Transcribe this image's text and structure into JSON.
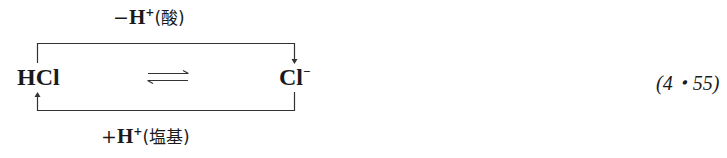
{
  "equation": {
    "top_label": {
      "sign": "−",
      "species": "H",
      "charge": "+",
      "annotation": "(酸)"
    },
    "bottom_label": {
      "sign": "+",
      "species": "H",
      "charge": "+",
      "annotation": "(塩基)"
    },
    "left_species": "HCl",
    "right_species": {
      "base": "Cl",
      "charge": "−"
    },
    "equilibrium_symbol": "⇌",
    "number": "(4・55)"
  }
}
